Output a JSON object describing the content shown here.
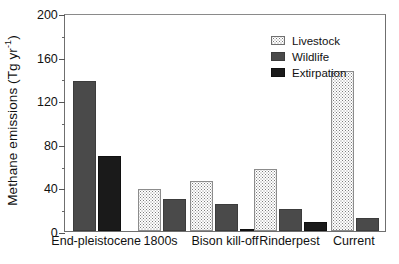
{
  "chart_data": {
    "type": "bar",
    "title": "",
    "subtitle": "",
    "xlabel": "",
    "ylabel": "Methane emissions (Tg yr",
    "ylabel_superscript": "-1",
    "ylabel_suffix": ")",
    "ylim": [
      0,
      200
    ],
    "ytick_major": [
      0,
      40,
      80,
      120,
      160,
      200
    ],
    "ytick_minor": [
      20,
      60,
      100,
      140,
      180
    ],
    "ytick_labels": [
      "0",
      "40",
      "80",
      "120",
      "160",
      "200"
    ],
    "grid": false,
    "legend_position": "top-center",
    "categories": [
      "End-pleistocene",
      "1800s",
      "Bison kill-off",
      "Rinderpest",
      "Current"
    ],
    "series": [
      {
        "name": "Livestock",
        "color": "#ffffff",
        "pattern": "stippled",
        "values": [
          null,
          39,
          46,
          57,
          147
        ]
      },
      {
        "name": "Wildlife",
        "color": "#4a4a4a",
        "pattern": "solid",
        "values": [
          138,
          29,
          25,
          20,
          12
        ]
      },
      {
        "name": "Extirpation",
        "color": "#1a1a1a",
        "pattern": "solid",
        "values": [
          69,
          null,
          1.5,
          8,
          null
        ]
      }
    ]
  },
  "legend": {
    "items": [
      {
        "label": "Livestock",
        "swatch": "livestock"
      },
      {
        "label": "Wildlife",
        "swatch": "wildlife"
      },
      {
        "label": "Extirpation",
        "swatch": "extirpation"
      }
    ]
  },
  "axis": {
    "y_title_main": "Methane emissions (Tg yr",
    "y_title_sup": "-1",
    "y_title_tail": ")"
  }
}
